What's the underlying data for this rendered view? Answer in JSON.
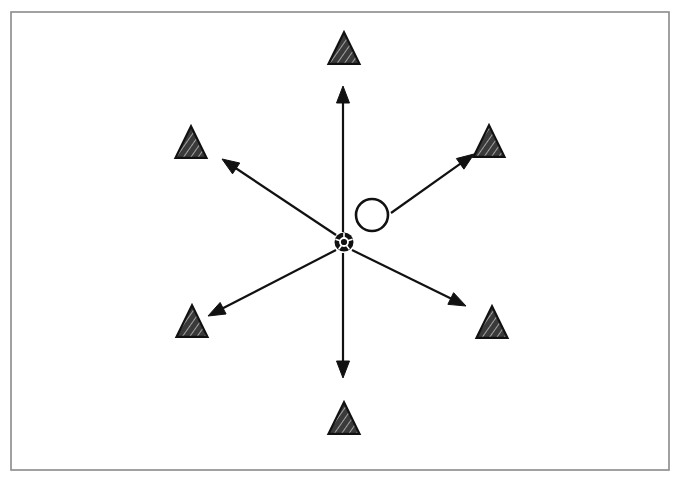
{
  "figure": {
    "width": 687,
    "height": 494,
    "background_color": "#ffffff",
    "stroke_color": "#111111"
  },
  "frame": {
    "label": "figure-border",
    "x": 11,
    "y": 12,
    "width": 658,
    "height": 458,
    "border_color": "#8a8a8a",
    "border_width": 1.6,
    "fill": "#ffffff"
  },
  "center": {
    "ball": {
      "label": "soccer-ball-marker",
      "cx": 344,
      "cy": 242,
      "r": 9.5,
      "fill": "#111111",
      "detail_color": "#ffffff"
    },
    "open_circle": {
      "label": "open-circle-marker",
      "cx": 372,
      "cy": 215,
      "r": 16,
      "fill": "none",
      "stroke": "#111111",
      "stroke_width": 2.6
    }
  },
  "arrows": {
    "count": 6,
    "stroke_color": "#111111",
    "stroke_width": 2.2,
    "head_length": 17,
    "head_width": 13,
    "items": [
      {
        "name": "arrow-up",
        "direction": "up",
        "x1": 343,
        "y1": 232,
        "x2": 343,
        "y2": 86
      },
      {
        "name": "arrow-upper-left",
        "direction": "upper-left",
        "x1": 336,
        "y1": 235,
        "x2": 222,
        "y2": 159
      },
      {
        "name": "arrow-upper-right",
        "direction": "upper-right",
        "x1": 391,
        "y1": 213,
        "x2": 474,
        "y2": 154
      },
      {
        "name": "arrow-lower-right",
        "direction": "lower-right",
        "x1": 352,
        "y1": 250,
        "x2": 466,
        "y2": 306
      },
      {
        "name": "arrow-lower-left",
        "direction": "lower-left",
        "x1": 336,
        "y1": 250,
        "x2": 208,
        "y2": 316
      },
      {
        "name": "arrow-down",
        "direction": "down",
        "x1": 343,
        "y1": 253,
        "x2": 343,
        "y2": 378
      }
    ]
  },
  "triangles": {
    "count": 6,
    "size": 31,
    "fill_color": "#3a3a3a",
    "outline_color": "#111111",
    "outline_width": 2.2,
    "hatch_color": "#d8d8d8",
    "items": [
      {
        "name": "triangle-north",
        "position": "north",
        "cx": 344,
        "cy": 48
      },
      {
        "name": "triangle-northwest",
        "position": "northwest",
        "cx": 191,
        "cy": 142
      },
      {
        "name": "triangle-northeast",
        "position": "northeast",
        "cx": 489,
        "cy": 141
      },
      {
        "name": "triangle-southeast",
        "position": "southeast",
        "cx": 492,
        "cy": 322
      },
      {
        "name": "triangle-southwest",
        "position": "southwest",
        "cx": 192,
        "cy": 321
      },
      {
        "name": "triangle-south",
        "position": "south",
        "cx": 344,
        "cy": 418
      }
    ]
  }
}
